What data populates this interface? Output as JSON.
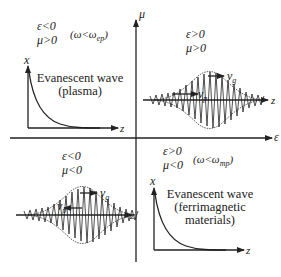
{
  "axes": {
    "horizontal_label": "ε",
    "vertical_label": "μ"
  },
  "quadrants": {
    "top_left": {
      "cond1": "ε<0",
      "cond2": "μ>0",
      "freq_condition": "(ω<ω",
      "freq_sub": "ep",
      "freq_close": ")",
      "plot_y_label": "x",
      "plot_x_label": "z",
      "title_line1": "Evanescent wave",
      "title_line2": "(plasma)"
    },
    "top_right": {
      "cond1": "ε>0",
      "cond2": "μ>0",
      "group_velocity": "v",
      "group_velocity_sub": "g",
      "phase_velocity": "v",
      "phase_velocity_sub": "p",
      "axis_label": "z"
    },
    "bottom_left": {
      "cond1": "ε<0",
      "cond2": "μ<0",
      "group_velocity": "v",
      "group_velocity_sub": "g",
      "phase_velocity": "v",
      "phase_velocity_sub": "p",
      "axis_label": "z"
    },
    "bottom_right": {
      "cond1": "ε>0",
      "cond2": "μ<0",
      "freq_condition": "(ω<ω",
      "freq_sub": "mp",
      "freq_close": ")",
      "plot_y_label": "x",
      "plot_x_label": "z",
      "title_line1": "Evanescent wave",
      "title_line2": "(ferrimagnetic",
      "title_line3": "materials)"
    }
  },
  "colors": {
    "ink": "#222222",
    "background": "#ffffff"
  }
}
